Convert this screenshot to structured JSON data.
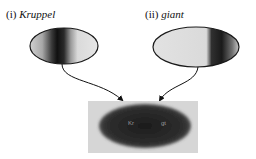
{
  "panels": [
    {
      "numeral": "(i)",
      "gene": "Kruppel",
      "stripe_position": "middle-anterior"
    },
    {
      "numeral": "(ii)",
      "gene": "giant",
      "stripe_position": "posterior"
    }
  ],
  "embryo": {
    "labels": [
      "Kr",
      "gt"
    ]
  },
  "colors": {
    "outline": "#1a1a1a",
    "light_fill": "#e4e4e4",
    "dark_band": "#151515",
    "photo_bg": "#d8d8d8",
    "photo_embryo": "#2a2a2a"
  }
}
